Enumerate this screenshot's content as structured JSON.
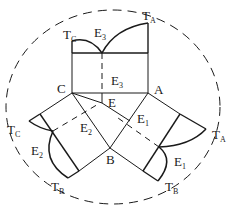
{
  "diagram": {
    "vertices": {
      "A": {
        "label": "A",
        "x": 148,
        "y": 93
      },
      "B": {
        "label": "B",
        "x": 110,
        "y": 148
      },
      "C": {
        "label": "C",
        "x": 72,
        "y": 93
      },
      "E": {
        "label": "E",
        "x": 102,
        "y": 103
      }
    },
    "labels": [
      {
        "id": "TC_top",
        "main": "T",
        "sub": "C",
        "x": 63,
        "y": 39
      },
      {
        "id": "E3_top",
        "main": "E",
        "sub": "3",
        "x": 95,
        "y": 38
      },
      {
        "id": "TA_top",
        "main": "T",
        "sub": "A",
        "x": 143,
        "y": 20
      },
      {
        "id": "C",
        "main": "C",
        "sub": "",
        "x": 58,
        "y": 92
      },
      {
        "id": "E3_mid",
        "main": "E",
        "sub": "3",
        "x": 111,
        "y": 85
      },
      {
        "id": "A",
        "main": "A",
        "sub": "",
        "x": 155,
        "y": 93
      },
      {
        "id": "E",
        "main": "E",
        "sub": "",
        "x": 108,
        "y": 106
      },
      {
        "id": "E2_inner",
        "main": "E",
        "sub": "2",
        "x": 81,
        "y": 131
      },
      {
        "id": "E1_inner",
        "main": "E",
        "sub": "1",
        "x": 138,
        "y": 123
      },
      {
        "id": "TC_left",
        "main": "T",
        "sub": "C",
        "x": 8,
        "y": 133
      },
      {
        "id": "E2_outer",
        "main": "E",
        "sub": "2",
        "x": 32,
        "y": 155
      },
      {
        "id": "B",
        "main": "B",
        "sub": "",
        "x": 106,
        "y": 164
      },
      {
        "id": "E1_outer",
        "main": "E",
        "sub": "1",
        "x": 175,
        "y": 166
      },
      {
        "id": "TA_right",
        "main": "T",
        "sub": "A",
        "x": 213,
        "y": 138
      },
      {
        "id": "TB_left",
        "main": "T",
        "sub": "B",
        "x": 52,
        "y": 190
      },
      {
        "id": "TB_right",
        "main": "T",
        "sub": "B",
        "x": 166,
        "y": 190
      }
    ],
    "colors": {
      "line": "#1a1a1a",
      "background": "#ffffff"
    }
  }
}
